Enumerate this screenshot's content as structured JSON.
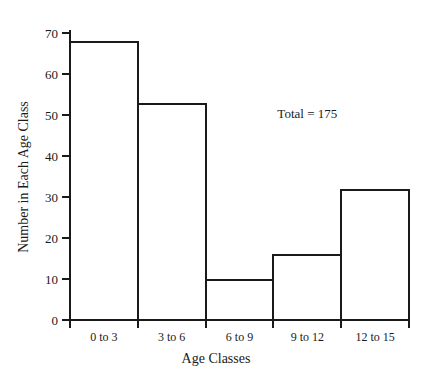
{
  "chart_data": {
    "type": "bar",
    "title": "",
    "subtitle": "",
    "xlabel": "Age Classes",
    "ylabel": "Number in Each Age Class",
    "categories": [
      "0 to 3",
      "3 to 6",
      "6 to 9",
      "9 to 12",
      "12 to 15"
    ],
    "values": [
      68,
      53,
      10,
      16,
      32
    ],
    "ylim": [
      0,
      70
    ],
    "yticks": [
      0,
      10,
      20,
      30,
      40,
      50,
      60,
      70
    ],
    "ytick_labels": [
      "0",
      "10",
      "20",
      "30",
      "40",
      "50",
      "60",
      "70"
    ],
    "grid": false,
    "legend": null,
    "bar_style": "histogram-outline",
    "annotations": [
      {
        "text": "Total  =  175",
        "x_category": "9 to 12",
        "y_value": 52
      }
    ],
    "colors": {
      "axis": "#1a1a1a",
      "bar_outline": "#1a1a1a",
      "bar_fill": "#ffffff",
      "background": "#ffffff",
      "text": "#1a1a1a"
    }
  }
}
